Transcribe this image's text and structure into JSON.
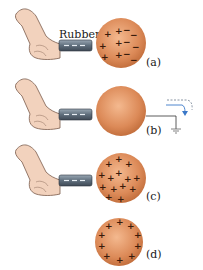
{
  "figure": {
    "rod_label": "Rubber",
    "panels": [
      {
        "id": "a",
        "label": "(a)",
        "sphere_state": "polarized (+ left, − right)",
        "has_rod": true,
        "grounded": false
      },
      {
        "id": "b",
        "label": "(b)",
        "sphere_state": "grounded, electrons flow to ground",
        "has_rod": true,
        "grounded": true
      },
      {
        "id": "c",
        "label": "(c)",
        "sphere_state": "net positive, charges concentrated near rod",
        "has_rod": true,
        "grounded": false
      },
      {
        "id": "d",
        "label": "(d)",
        "sphere_state": "net positive, uniformly distributed on surface",
        "has_rod": false,
        "grounded": false
      }
    ],
    "colors": {
      "sphere": "#d98a5a",
      "sphere_highlight": "#f2b48a",
      "rod": "#6a7a88",
      "skin": "#f0cdb8",
      "ground_arrow": "#3a78c8"
    }
  }
}
